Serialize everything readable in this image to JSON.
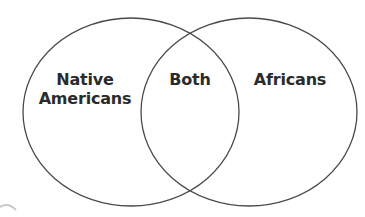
{
  "diagram": {
    "type": "venn",
    "left_set": {
      "label_line1": "Native",
      "label_line2": "Americans"
    },
    "intersection": {
      "label": "Both"
    },
    "right_set": {
      "label": "Africans"
    }
  },
  "colors": {
    "stroke": "#4a4a4a",
    "text": "#2b2b2b",
    "background": "#ffffff",
    "corner_arc": "#c8c8c8"
  }
}
